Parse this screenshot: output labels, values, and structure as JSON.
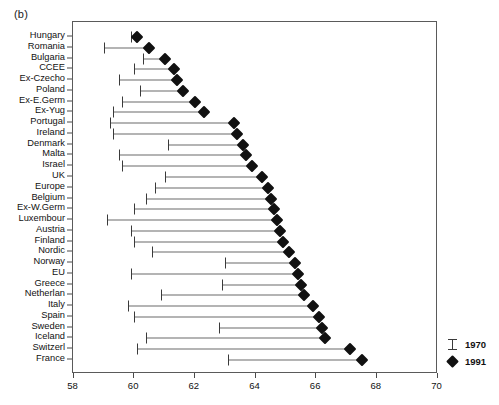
{
  "figure": {
    "panel_label": "(b)"
  },
  "legend": {
    "entries": [
      {
        "label": "1970",
        "marker": "ibeam-icon"
      },
      {
        "label": "1991",
        "marker": "diamond-icon"
      }
    ]
  },
  "x_axis": {
    "ticks": [
      "58",
      "60",
      "62",
      "64",
      "66",
      "68",
      "70"
    ],
    "tick_values": [
      58,
      60,
      62,
      64,
      66,
      68,
      70
    ],
    "min": 58,
    "max": 70
  },
  "chart_data": {
    "type": "bar",
    "subtype": "dumbbell-range",
    "title": "",
    "subtitle": "",
    "xlabel": "",
    "ylabel": "",
    "xlim": [
      58,
      70
    ],
    "grid": false,
    "legend_position": "bottom-right-outside",
    "categories": [
      "Hungary",
      "Romania",
      "Bulgaria",
      "CCEE",
      "Ex-Czecho",
      "Poland",
      "Ex-E.Germ",
      "Ex-Yug",
      "Portugal",
      "Ireland",
      "Denmark",
      "Malta",
      "Israel",
      "UK",
      "Europe",
      "Belgium",
      "Ex-W.Germ",
      "Luxembour",
      "Austria",
      "Finland",
      "Nordic",
      "Norway",
      "EU",
      "Greece",
      "Netherlan",
      "Italy",
      "Spain",
      "Sweden",
      "Iceland",
      "Switzerl",
      "France"
    ],
    "series": [
      {
        "name": "1970",
        "marker": "ibeam",
        "values": [
          59.9,
          59.0,
          60.3,
          60.0,
          59.5,
          60.2,
          59.6,
          59.3,
          59.2,
          59.3,
          61.1,
          59.5,
          59.6,
          61.0,
          60.7,
          60.4,
          60.0,
          59.1,
          59.9,
          60.0,
          60.6,
          63.0,
          59.9,
          62.9,
          60.9,
          59.8,
          60.0,
          62.8,
          60.4,
          60.1,
          63.1
        ]
      },
      {
        "name": "1991",
        "marker": "diamond",
        "values": [
          60.1,
          60.5,
          61.0,
          61.3,
          61.4,
          61.6,
          62.0,
          62.3,
          63.3,
          63.4,
          63.6,
          63.7,
          63.9,
          64.2,
          64.4,
          64.5,
          64.6,
          64.7,
          64.8,
          64.9,
          65.1,
          65.3,
          65.4,
          65.5,
          65.6,
          65.9,
          66.1,
          66.2,
          66.3,
          67.1,
          67.5
        ]
      }
    ]
  }
}
